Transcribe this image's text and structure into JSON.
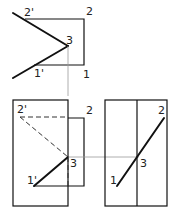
{
  "diagram": {
    "type": "orthographic projection of intersecting line and plane",
    "top_view": {
      "labels": {
        "p2prime": "2'",
        "p2": "2",
        "p3": "3",
        "p1prime": "1'",
        "p1": "1"
      }
    },
    "front_view": {
      "labels": {
        "p2prime": "2'",
        "p2": "2",
        "p3": "3",
        "p1prime": "1'"
      }
    },
    "side_view": {
      "labels": {
        "p2": "2",
        "p3": "3",
        "p1": "1"
      }
    },
    "colors": {
      "line": "#111111",
      "projector": "#999999",
      "background": "#ffffff"
    }
  }
}
